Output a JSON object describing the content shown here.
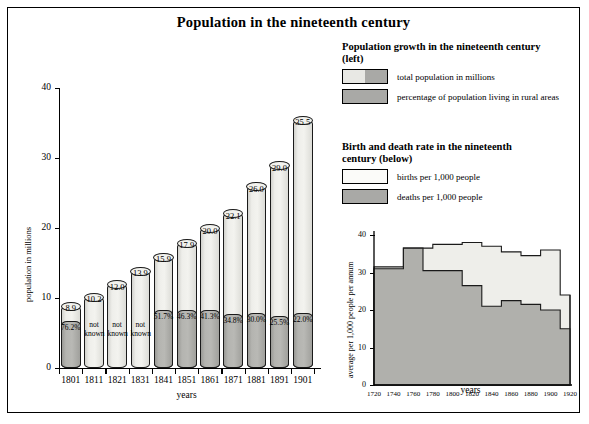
{
  "title": "Population in the nineteenth century",
  "legends": [
    {
      "id": "population-growth",
      "heading": "Population growth in the nineteenth century (left)",
      "items": [
        {
          "label": "total population in millions",
          "style": "split"
        },
        {
          "label": "percentage of population living in rural areas",
          "style": "dark"
        }
      ]
    },
    {
      "id": "birth-death-rate",
      "heading": "Birth and death rate in the nineteenth century (below)",
      "items": [
        {
          "label": "births per 1,000 people",
          "style": "white"
        },
        {
          "label": "deaths per 1,000 people",
          "style": "dark"
        }
      ]
    }
  ],
  "chart_data": [
    {
      "type": "bar",
      "id": "population-growth-chart",
      "title": "Population growth in the nineteenth century",
      "xlabel": "years",
      "ylabel": "population in millions",
      "ylim": [
        0,
        40
      ],
      "yticks": [
        0,
        10,
        20,
        30,
        40
      ],
      "grid": false,
      "categories": [
        "1801",
        "1811",
        "1821",
        "1831",
        "1841",
        "1851",
        "1861",
        "1871",
        "1881",
        "1891",
        "1901"
      ],
      "series": [
        {
          "name": "total population in millions",
          "values": [
            8.9,
            10.2,
            12.0,
            13.9,
            15.9,
            17.9,
            20.0,
            22.1,
            26.0,
            29.0,
            35.5
          ],
          "labels": [
            "8.9",
            "10.2",
            "12.0",
            "13.9",
            "15.9",
            "17.9",
            "20.0",
            "22.1",
            "26.0",
            "29.0",
            "35.5"
          ]
        },
        {
          "name": "percentage of population living in rural areas",
          "values": [
            76.2,
            null,
            null,
            null,
            51.7,
            46.3,
            41.3,
            34.8,
            30.0,
            25.5,
            22.0
          ],
          "labels": [
            "76.2%",
            "not known",
            "not known",
            "not known",
            "51.7%",
            "46.3%",
            "41.3%",
            "34.8%",
            "30.0%",
            "25.5%",
            "22.0%"
          ]
        }
      ]
    },
    {
      "type": "area",
      "id": "birth-death-rate-chart",
      "title": "Birth and death rate in the nineteenth century",
      "xlabel": "years",
      "ylabel": "average per 1,000 people per annum",
      "ylim": [
        0,
        40
      ],
      "yticks": [
        0,
        10,
        20,
        30,
        40
      ],
      "xticks": [
        "1720",
        "1740",
        "1760",
        "1780",
        "1800",
        "1820",
        "1840",
        "1860",
        "1880",
        "1900",
        "1920"
      ],
      "xlim": [
        1720,
        1920
      ],
      "grid": false,
      "step": true,
      "series": [
        {
          "name": "births per 1,000 people",
          "x": [
            1720,
            1730,
            1740,
            1750,
            1760,
            1770,
            1780,
            1790,
            1800,
            1810,
            1820,
            1830,
            1840,
            1850,
            1860,
            1870,
            1880,
            1890,
            1900,
            1910,
            1920
          ],
          "values": [
            31.5,
            31.5,
            31.5,
            36.5,
            36.5,
            36.5,
            37.5,
            37.5,
            37.5,
            38.0,
            38.0,
            37.0,
            37.0,
            35.5,
            35.5,
            34.5,
            34.5,
            36.0,
            36.0,
            24.0,
            24.0
          ]
        },
        {
          "name": "deaths per 1,000 people",
          "x": [
            1720,
            1730,
            1740,
            1750,
            1760,
            1770,
            1780,
            1790,
            1800,
            1810,
            1820,
            1830,
            1840,
            1850,
            1860,
            1870,
            1880,
            1890,
            1900,
            1910,
            1920
          ],
          "values": [
            31.0,
            31.0,
            31.0,
            36.5,
            36.5,
            30.5,
            30.5,
            30.5,
            30.5,
            26.5,
            26.5,
            21.0,
            21.0,
            22.5,
            22.5,
            21.5,
            21.5,
            20.0,
            20.0,
            15.0,
            15.0
          ]
        }
      ]
    }
  ],
  "colors": {
    "light": "#eeeeea",
    "dark": "#b0b0ac",
    "white": "#fbfbf9",
    "stroke": "#1a1a1a"
  }
}
